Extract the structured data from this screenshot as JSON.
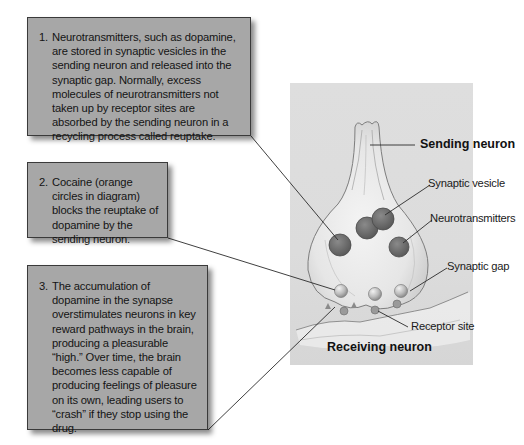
{
  "callouts": [
    {
      "number": "1.",
      "text": "Neurotransmitters, such as dopamine, are stored in synaptic vesicles in the sending neuron and released into the synaptic gap. Normally, excess molecules of neurotransmitters not taken up by receptor sites are absorbed by the sending neuron in a recycling process called reuptake."
    },
    {
      "number": "2.",
      "text": "Cocaine (orange circles in diagram) blocks the reuptake of dopamine by the sending neuron."
    },
    {
      "number": "3.",
      "text": "The accumulation of dopamine in the synapse overstimulates neurons in key reward pathways in the  brain, producing a pleasurable “high.” Over time, the brain becomes less capable of producing feelings of pleasure on its own, leading users to “crash” if they stop using the drug."
    }
  ],
  "labels": {
    "sending_neuron": "Sending neuron",
    "synaptic_vesicle": "Synaptic vesicle",
    "neurotransmitters": "Neurotransmitters",
    "synaptic_gap": "Synaptic gap",
    "receptor_site": "Receptor site",
    "receiving_neuron": "Receiving neuron"
  },
  "colors": {
    "callout_fill": "#a7a7a7",
    "callout_border": "#3a3a3a",
    "panel_fill": "#dcdcdc",
    "vesicle_fill": "#6e6e6e",
    "leader_line": "#2a2a2a"
  }
}
